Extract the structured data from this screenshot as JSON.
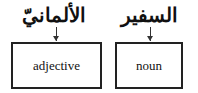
{
  "diagram": {
    "words": [
      {
        "arabic": "الألمانيّ",
        "label": "adjective"
      },
      {
        "arabic": "السفير",
        "label": "noun"
      }
    ]
  }
}
